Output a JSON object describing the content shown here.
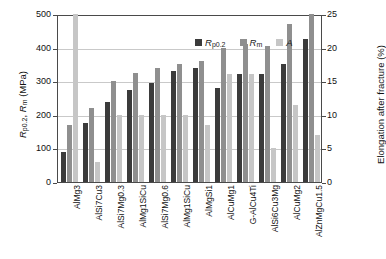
{
  "chart_data": {
    "type": "bar",
    "title": "",
    "subtitle": "",
    "grid": true,
    "legend_position": "top-center",
    "categories": [
      "AlMg3",
      "AlSi7Cu3",
      "AlSi7Mg0.3",
      "AlMg1SiCu",
      "AlSi7Mg0.6",
      "AlMg1SiCu",
      "AlMgSi1",
      "AlCuMg1",
      "G-AlCu4Ti",
      "AlSi6Cu3Mg",
      "AlCuMg2",
      "AlZnMgCu1.5"
    ],
    "series": [
      {
        "name": "Rp0.2",
        "label_html": "R<sub>p0.2</sub>",
        "axis": "left",
        "color": "#3b3b3b",
        "unit": "MPa",
        "values": [
          90,
          175,
          237,
          275,
          295,
          330,
          340,
          280,
          320,
          320,
          350,
          425
        ]
      },
      {
        "name": "Rm",
        "label_html": "R<sub>m</sub>",
        "axis": "left",
        "color": "#8f8f8f",
        "unit": "MPa",
        "values": [
          170,
          220,
          300,
          325,
          340,
          350,
          360,
          400,
          410,
          405,
          470,
          500
        ]
      },
      {
        "name": "A",
        "label_html": "A",
        "axis": "right",
        "color": "#c6c6c6",
        "unit": "%",
        "values": [
          25,
          3,
          10,
          10,
          10,
          10,
          8.5,
          16,
          16,
          5,
          11.5,
          7
        ]
      }
    ],
    "left_axis": {
      "label": "Rp0.2, Rm (MPa)",
      "min": 0,
      "max": 500,
      "step": 100,
      "ticks": [
        "0",
        "100",
        "200",
        "300",
        "400",
        "500"
      ]
    },
    "right_axis": {
      "label": "Elongation after fracture (%)",
      "min": 0,
      "max": 25,
      "step": 5,
      "ticks": [
        "0",
        "5",
        "10",
        "15",
        "20",
        "25"
      ]
    },
    "xlabel": ""
  },
  "legend": {
    "items": [
      {
        "key": "rp02",
        "color": "#3b3b3b"
      },
      {
        "key": "rm",
        "color": "#8f8f8f"
      },
      {
        "key": "a",
        "color": "#c6c6c6"
      }
    ]
  }
}
